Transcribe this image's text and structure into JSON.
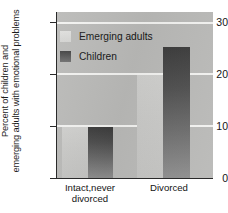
{
  "chart_data": {
    "type": "bar",
    "title": "",
    "xlabel": "",
    "ylabel_line1": "Percent of children and",
    "ylabel_line2": "emerging adults with emotional problems",
    "ylabel_full": "Percent of children and emerging adults with emotional problems",
    "categories": [
      "Intact,never divorced",
      "Divorced"
    ],
    "category_lines": [
      [
        "Intact,never",
        "divorced"
      ],
      [
        "Divorced"
      ]
    ],
    "series": [
      {
        "name": "Emerging adults",
        "values": [
          10,
          20
        ],
        "color": "#cbcbc9"
      },
      {
        "name": "Children",
        "values": [
          10,
          25.5
        ],
        "color": "#4e4e4e"
      }
    ],
    "ylim": [
      0,
      32
    ],
    "yticks": [
      0,
      10,
      20,
      30
    ],
    "ytick_labels": [
      "0",
      "10",
      "20",
      "30"
    ],
    "grid": true,
    "gridlines_at": [
      10,
      20,
      30
    ],
    "legend_position": "upper left inside plot",
    "plot_background": "#b9b9b7",
    "gridline_color": "#f2f2f0",
    "axis_color": "#2a2a2a"
  },
  "axis": {
    "ticks": [
      {
        "value": "30"
      },
      {
        "value": "20"
      },
      {
        "value": "10"
      },
      {
        "value": "0"
      }
    ]
  },
  "legend": {
    "items": [
      {
        "label": "Emerging adults",
        "swatch": "light-gray-swatch"
      },
      {
        "label": "Children",
        "swatch": "dark-gray-swatch"
      }
    ]
  },
  "categories": {
    "intact": {
      "line1": "Intact,never",
      "line2": "divorced"
    },
    "divorced": {
      "line1": "Divorced"
    }
  }
}
